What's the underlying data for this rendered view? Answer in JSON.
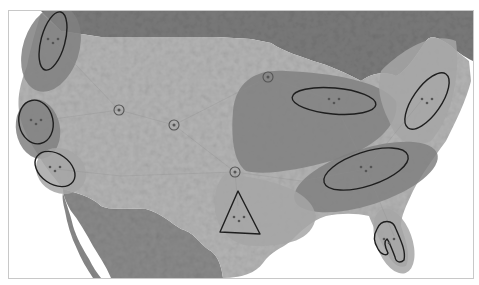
{
  "map": {
    "type": "megaregions-map",
    "style": "grayscale-relief",
    "colors": {
      "background_water": "#ffffff",
      "canada": "#7a7a7a",
      "mexico": "#8a8a8a",
      "us_land": "#b4b4b4",
      "megaregion_light": "#a6a6a6",
      "megaregion_dark": "#808080",
      "outline": "#1e1e1e"
    },
    "frame": {
      "x": 8,
      "y": 10,
      "width": 464,
      "height": 267
    },
    "megaregions": [
      {
        "id": "cascadia",
        "shade": "dark",
        "cx": 50,
        "cy": 48,
        "rx": 28,
        "ry": 44,
        "rotate": 18
      },
      {
        "id": "northern-california",
        "shade": "dark",
        "cx": 37,
        "cy": 128,
        "rx": 22,
        "ry": 30,
        "rotate": -10
      },
      {
        "id": "southern-california",
        "shade": "light",
        "cx": 60,
        "cy": 170,
        "rx": 26,
        "ry": 22,
        "rotate": 30
      },
      {
        "id": "great-lakes",
        "shade": "dark",
        "path": "M232,110 C235,80 255,68 285,70 C330,72 380,80 395,100 C400,125 370,150 330,160 C300,168 265,175 245,170 C232,160 230,135 232,110 Z"
      },
      {
        "id": "northeast",
        "shade": "light",
        "path": "M380,70 C400,50 430,30 455,40 C460,80 448,120 430,140 C410,148 395,140 388,120 C378,100 376,85 380,70 Z"
      },
      {
        "id": "piedmont-atlantic",
        "shade": "dark",
        "cx": 365,
        "cy": 176,
        "rx": 75,
        "ry": 28,
        "rotate": -18
      },
      {
        "id": "texas-triangle",
        "shade": "light",
        "path": "M225,172 C260,178 310,185 315,215 C312,240 285,245 255,245 C230,245 218,230 214,210 C212,190 218,178 225,172 Z"
      },
      {
        "id": "florida",
        "shade": "light",
        "cx": 393,
        "cy": 240,
        "rx": 18,
        "ry": 34,
        "rotate": -20
      }
    ],
    "cluster_outlines": [
      {
        "id": "seattle-portland",
        "shape": "ellipse",
        "cx": 52,
        "cy": 40,
        "rx": 12,
        "ry": 30,
        "rotate": 15
      },
      {
        "id": "sf-bay",
        "shape": "ellipse",
        "cx": 35,
        "cy": 121,
        "rx": 17,
        "ry": 22,
        "rotate": -12
      },
      {
        "id": "los-angeles",
        "shape": "ellipse",
        "cx": 54,
        "cy": 168,
        "rx": 22,
        "ry": 15,
        "rotate": 35
      },
      {
        "id": "chicago-detroit",
        "shape": "ellipse",
        "cx": 333,
        "cy": 100,
        "rx": 42,
        "ry": 13,
        "rotate": 5
      },
      {
        "id": "boston-washington",
        "shape": "ellipse",
        "cx": 426,
        "cy": 100,
        "rx": 14,
        "ry": 33,
        "rotate": 35
      },
      {
        "id": "atlanta-charlotte",
        "shape": "ellipse",
        "cx": 365,
        "cy": 168,
        "rx": 44,
        "ry": 17,
        "rotate": -18
      },
      {
        "id": "texas-triangle-outline",
        "shape": "polygon",
        "points": "237,190 219,231 259,233"
      },
      {
        "id": "florida-outline",
        "shape": "path",
        "d": "M376,228 C380,218 392,218 395,228 C400,240 405,250 403,259 C400,262 395,262 394,256 C391,248 388,240 386,238 C383,240 384,246 387,252 C386,255 380,254 377,248 C372,240 373,233 376,228 Z"
      }
    ],
    "small_city_markers": [
      {
        "id": "boise",
        "cx": 118,
        "cy": 109,
        "r": 5
      },
      {
        "id": "denver",
        "cx": 173,
        "cy": 124,
        "r": 5
      },
      {
        "id": "minneapolis",
        "cx": 267,
        "cy": 76,
        "r": 5
      },
      {
        "id": "oklahoma-city",
        "cx": 234,
        "cy": 171,
        "r": 5
      }
    ]
  }
}
